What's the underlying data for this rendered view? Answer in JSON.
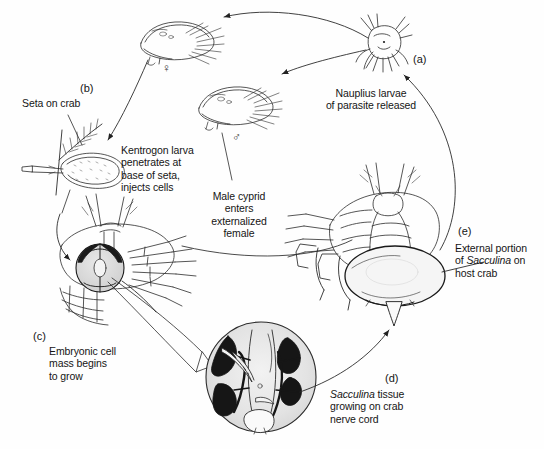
{
  "figure": {
    "background_color": "#fefefe",
    "ink_color": "#151515"
  },
  "stages": [
    {
      "tag": "(a)",
      "caption": "Nauplius larvae\nof parasite released",
      "subject": "nauplius-larva"
    },
    {
      "tag": "(b)",
      "caption": "Kentrogon larva\npenetrates at\nbase of seta,\ninjects cells",
      "subject": "kentrogon-larva"
    },
    {
      "tag": "(c)",
      "caption": "Embryonic cell\nmass begins\nto grow",
      "subject": "crab-ventral-embryonic-mass"
    },
    {
      "tag": "(d)",
      "caption_parts": {
        "italic": "Sacculina",
        "rest": " tissue\ngrowing on crab\nnerve cord"
      },
      "subject": "nerve-cord-microscope-circle"
    },
    {
      "tag": "(e)",
      "caption_parts": {
        "pre": "External portion\nof ",
        "italic": "Sacculina",
        "post": " on\nhost crab"
      },
      "subject": "crab-with-external-sacculina"
    }
  ],
  "annotations": {
    "seta_on_crab": "Seta on crab",
    "male_cyprid": "Male cyprid\nenters\nexternalized\nfemale"
  },
  "symbols": {
    "female": "♀",
    "male": "♂"
  }
}
